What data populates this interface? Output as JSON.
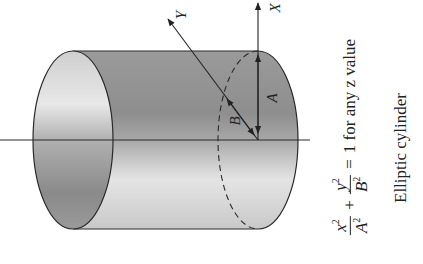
{
  "diagram": {
    "title": "Elliptic cylinder",
    "orientation": "rotated -90deg (text reads bottom-to-top)",
    "axes": {
      "x_label": "X",
      "y_label": "Y",
      "z_label": "z"
    },
    "dimensions": {
      "a_label": "A",
      "b_label": "B"
    },
    "equation": {
      "term1_num": "x",
      "term1_num_exp": "2",
      "term1_den": "A",
      "term1_den_exp": "2",
      "plus": "+",
      "term2_num": "y",
      "term2_num_exp": "2",
      "term2_den": "B",
      "term2_den_exp": "2",
      "equals": "=",
      "rhs": "1 for any z value"
    },
    "caption": "Elliptic cylinder",
    "colors": {
      "outline": "#2a2a2a",
      "body_dark": "#8c8c8c",
      "body_light": "#e6e6e6",
      "background": "#ffffff"
    }
  }
}
